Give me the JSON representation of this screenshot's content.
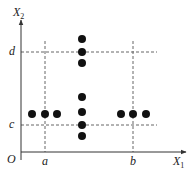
{
  "diagram": {
    "axes": {
      "x_label": "X",
      "x_label_sub": "1",
      "y_label": "X",
      "y_label_sub": "2",
      "origin_label": "O"
    },
    "ticks": {
      "x": [
        {
          "label": "a",
          "x": 45
        },
        {
          "label": "b",
          "x": 133
        }
      ],
      "y": [
        {
          "label": "c",
          "y": 125
        },
        {
          "label": "d",
          "y": 52
        }
      ]
    },
    "points": [
      {
        "x": 32,
        "y": 114
      },
      {
        "x": 45,
        "y": 114
      },
      {
        "x": 57,
        "y": 114
      },
      {
        "x": 121,
        "y": 114
      },
      {
        "x": 133,
        "y": 114
      },
      {
        "x": 146,
        "y": 114
      },
      {
        "x": 82,
        "y": 39
      },
      {
        "x": 82,
        "y": 52
      },
      {
        "x": 82,
        "y": 63
      },
      {
        "x": 82,
        "y": 97
      },
      {
        "x": 82,
        "y": 112
      },
      {
        "x": 82,
        "y": 125
      },
      {
        "x": 82,
        "y": 136
      }
    ],
    "colors": {
      "axis": "#333333",
      "dash": "#666666",
      "point": "#111111"
    }
  }
}
